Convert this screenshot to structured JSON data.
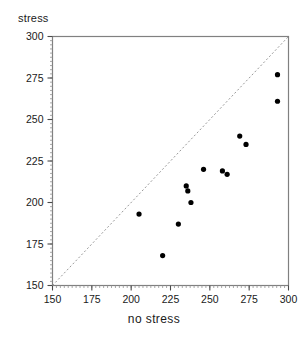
{
  "chart_data": {
    "type": "scatter",
    "title": "",
    "xlabel": "no stress",
    "ylabel": "stress",
    "xlim": [
      150,
      300
    ],
    "ylim": [
      150,
      300
    ],
    "xticks": [
      150,
      175,
      200,
      225,
      250,
      275,
      300
    ],
    "yticks": [
      150,
      175,
      200,
      225,
      250,
      275,
      300
    ],
    "xtick_labels": [
      "150",
      "175",
      "200",
      "225",
      "250",
      "275",
      "300"
    ],
    "ytick_labels": [
      "150",
      "175",
      "200",
      "225",
      "250",
      "275",
      "300"
    ],
    "grid": false,
    "legend": null,
    "marker_color": "#000000",
    "marker_size": 4,
    "axis_color": "#808080",
    "points": [
      {
        "x": 205,
        "y": 193
      },
      {
        "x": 220,
        "y": 168
      },
      {
        "x": 230,
        "y": 187
      },
      {
        "x": 235,
        "y": 210
      },
      {
        "x": 236,
        "y": 207
      },
      {
        "x": 238,
        "y": 200
      },
      {
        "x": 246,
        "y": 220
      },
      {
        "x": 258,
        "y": 219
      },
      {
        "x": 261,
        "y": 217
      },
      {
        "x": 269,
        "y": 240
      },
      {
        "x": 273,
        "y": 235
      },
      {
        "x": 293,
        "y": 277
      },
      {
        "x": 293,
        "y": 261
      }
    ],
    "reference_line": {
      "name": "identity-line",
      "style": "dashed",
      "color": "#999999",
      "from": {
        "x": 150,
        "y": 150
      },
      "to": {
        "x": 300,
        "y": 300
      }
    }
  }
}
